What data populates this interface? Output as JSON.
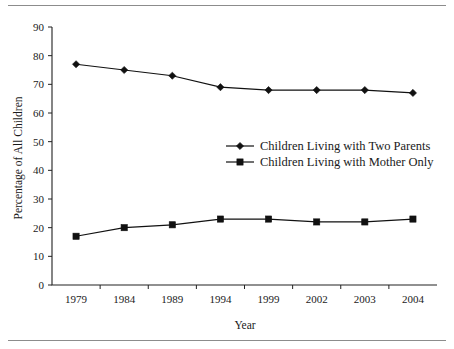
{
  "chart_data": {
    "type": "line",
    "title": "",
    "xlabel": "Year",
    "ylabel": "Percentage of All Children",
    "categories": [
      "1979",
      "1984",
      "1989",
      "1994",
      "1999",
      "2002",
      "2003",
      "2004"
    ],
    "ylim": [
      0,
      90
    ],
    "ytick_labels": [
      "0",
      "10",
      "20",
      "30",
      "40",
      "50",
      "60",
      "70",
      "80",
      "90"
    ],
    "yticks": [
      0,
      10,
      20,
      30,
      40,
      50,
      60,
      70,
      80,
      90
    ],
    "grid": false,
    "legend_position": "center-right",
    "series": [
      {
        "name": "Children Living with Two Parents",
        "marker": "diamond",
        "values": [
          77,
          75,
          73,
          69,
          68,
          68,
          68,
          67
        ]
      },
      {
        "name": "Children Living with Mother Only",
        "marker": "square",
        "values": [
          17,
          20,
          21,
          23,
          23,
          22,
          22,
          23
        ]
      }
    ]
  },
  "figure": {
    "top_rule": "horizontal-rule",
    "bottom_rule": "horizontal-rule"
  }
}
